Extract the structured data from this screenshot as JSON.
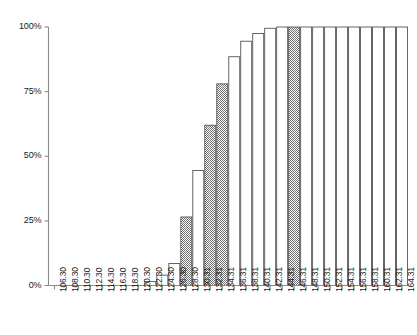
{
  "chart_data": {
    "type": "bar",
    "title": "",
    "subtitle": "",
    "xlabel": "",
    "ylabel": "",
    "categories": [
      "106.30",
      "108.30",
      "110.30",
      "112.30",
      "114.30",
      "116.30",
      "118.30",
      "120.30",
      "122.30",
      "124.30",
      "126.30",
      "128.30",
      "130.31",
      "132.31",
      "134.31",
      "136.31",
      "138.31",
      "140.31",
      "142.31",
      "144.31",
      "146.31",
      "148.31",
      "150.31",
      "152.31",
      "154.31",
      "156.31",
      "158.31",
      "160.31",
      "162.31",
      "164.31"
    ],
    "values": [
      0,
      0,
      0,
      0,
      0,
      0,
      0,
      0,
      1.5,
      4,
      8.5,
      26.5,
      44.5,
      62,
      78,
      88.5,
      94.5,
      97.5,
      99.5,
      100,
      100,
      100,
      100,
      100,
      100,
      100,
      100,
      100,
      100,
      100
    ],
    "bar_styles": [
      "plain",
      "plain",
      "plain",
      "plain",
      "plain",
      "plain",
      "plain",
      "plain",
      "plain",
      "plain",
      "plain",
      "hatched",
      "plain",
      "hatched",
      "hatched",
      "plain",
      "plain",
      "plain",
      "plain",
      "plain",
      "hatched",
      "plain",
      "plain",
      "plain",
      "plain",
      "plain",
      "plain",
      "plain",
      "plain",
      "plain"
    ],
    "ylim": [
      0,
      100
    ],
    "ytick_values": [
      0,
      25,
      50,
      75,
      100
    ],
    "ytick_labels": [
      "0%",
      "25%",
      "50%",
      "75%",
      "100%"
    ],
    "grid": false,
    "legend": "none",
    "legend_position": "none",
    "annotations": [],
    "colors": {
      "bar_fill_plain": "#ffffff",
      "bar_fill_hatched": "#8c8c8c",
      "bar_stroke": "#555555",
      "axis": "#888888",
      "text": "#1a1a1a",
      "background": "#ffffff"
    }
  }
}
